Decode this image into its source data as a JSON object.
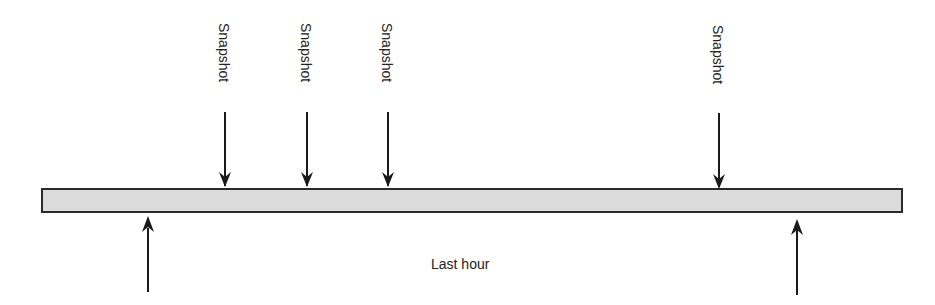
{
  "diagram": {
    "timeline": {
      "x1": 42,
      "x2": 902,
      "y1": 189,
      "y2": 212,
      "fill": "#dcdcdc",
      "stroke": "#2a2a2a"
    },
    "snapshots": [
      {
        "label": "Snapshot",
        "x": 225
      },
      {
        "label": "Snapshot",
        "x": 307
      },
      {
        "label": "Snapshot",
        "x": 388
      },
      {
        "label": "Snapshot",
        "x": 719
      }
    ],
    "window_markers": [
      {
        "x": 148
      },
      {
        "x": 797
      }
    ],
    "window_label": "Last hour"
  }
}
